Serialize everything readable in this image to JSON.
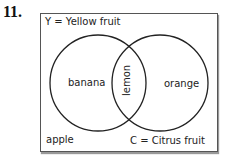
{
  "question_number": "11.",
  "diagram": {
    "type": "venn",
    "sets": [
      {
        "id": "Y",
        "label": "Y = Yellow fruit"
      },
      {
        "id": "C",
        "label": "C = Citrus fruit"
      }
    ],
    "regions": {
      "Y_only": "banana",
      "intersection": "lemon",
      "C_only": "orange",
      "outside": "apple"
    }
  }
}
